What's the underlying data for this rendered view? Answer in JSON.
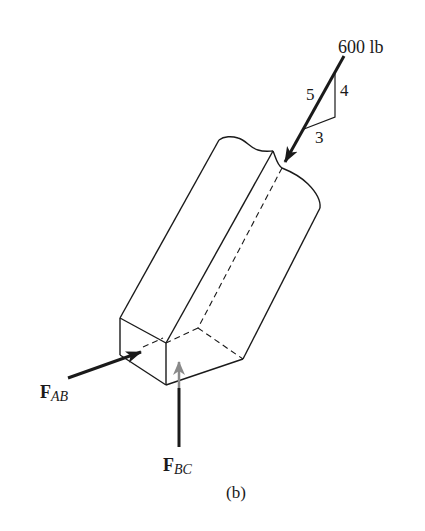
{
  "figure": {
    "caption": "(b)",
    "load": {
      "label": "600 lb",
      "slope_triangle": {
        "hypotenuse": "5",
        "vertical": "4",
        "horizontal": "3"
      }
    },
    "forces": [
      {
        "id": "F_AB",
        "symbol": "F",
        "subscript": "AB"
      },
      {
        "id": "F_BC",
        "symbol": "F",
        "subscript": "BC"
      }
    ],
    "colors": {
      "line": "#1a1a1a",
      "hidden_arrow": "#888888",
      "background": "#ffffff"
    }
  }
}
